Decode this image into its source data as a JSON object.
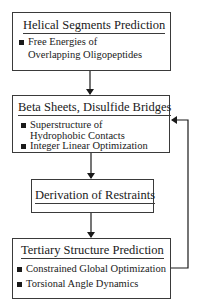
{
  "diagram": {
    "boxes": [
      {
        "title": "Helical Segments Prediction",
        "items": [
          {
            "line1": "Free Energies of",
            "line2": "Overlapping Oligopeptides"
          }
        ]
      },
      {
        "title": "Beta Sheets, Disulfide Bridges",
        "items": [
          {
            "line1": "Superstructure of",
            "line2": "Hydrophobic Contacts"
          },
          {
            "line1": "Integer Linear Optimization"
          }
        ]
      },
      {
        "title": "Derivation of Restraints",
        "items": []
      },
      {
        "title": "Tertiary Structure Prediction",
        "items": [
          {
            "line1": "Constrained Global Optimization"
          },
          {
            "line1": "Torsional Angle Dynamics"
          }
        ]
      }
    ],
    "edges": [
      {
        "from": "Helical Segments Prediction",
        "to": "Beta Sheets, Disulfide Bridges"
      },
      {
        "from": "Beta Sheets, Disulfide Bridges",
        "to": "Derivation of Restraints"
      },
      {
        "from": "Derivation of Restraints",
        "to": "Tertiary Structure Prediction"
      },
      {
        "from": "Tertiary Structure Prediction",
        "to": "Beta Sheets, Disulfide Bridges",
        "type": "feedback"
      }
    ]
  }
}
